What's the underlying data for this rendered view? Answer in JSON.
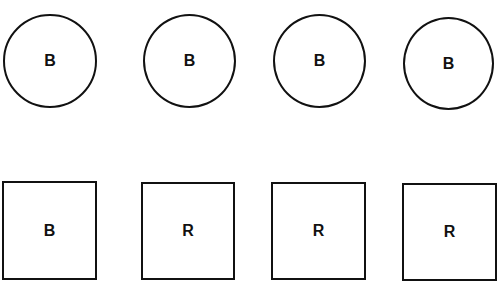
{
  "diagram": {
    "circles": [
      {
        "label": "B",
        "x": 3,
        "y": 14,
        "w": 94,
        "h": 94
      },
      {
        "label": "B",
        "x": 143,
        "y": 14,
        "w": 93,
        "h": 94
      },
      {
        "label": "B",
        "x": 273,
        "y": 14,
        "w": 93,
        "h": 94
      },
      {
        "label": "B",
        "x": 403,
        "y": 17,
        "w": 91,
        "h": 93
      }
    ],
    "squares": [
      {
        "label": "B",
        "x": 2,
        "y": 181,
        "w": 95,
        "h": 99
      },
      {
        "label": "R",
        "x": 141,
        "y": 182,
        "w": 94,
        "h": 98
      },
      {
        "label": "R",
        "x": 271,
        "y": 182,
        "w": 95,
        "h": 98
      },
      {
        "label": "R",
        "x": 402,
        "y": 183,
        "w": 95,
        "h": 98
      }
    ],
    "stroke_color": "#111111",
    "background_color": "#ffffff"
  }
}
